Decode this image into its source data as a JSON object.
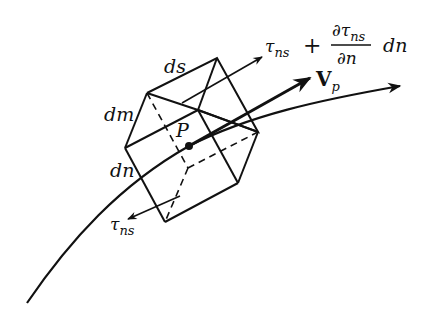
{
  "diagram": {
    "type": "fluid-element-on-streamline",
    "labels": {
      "point": "P",
      "edge_s": "ds",
      "edge_m": "dm",
      "edge_n": "dn",
      "velocity_symbol": "V",
      "velocity_sub": "p",
      "stress_lower": "τ",
      "stress_lower_sub": "ns",
      "stress_upper": "τ",
      "stress_upper_sub": "ns",
      "plus": "+",
      "partial_num": "∂τ",
      "partial_num_sub": "ns",
      "partial_den": "∂n",
      "dn_suffix": "dn"
    },
    "colors": {
      "stroke": "#111111",
      "background": "#ffffff"
    }
  }
}
